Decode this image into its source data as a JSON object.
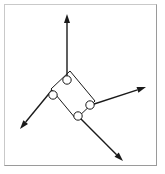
{
  "figure": {
    "canvas": {
      "width": 165,
      "height": 174
    },
    "colors": {
      "background": "#ffffff",
      "frame_light": "#c9c9c9",
      "frame_dark": "#9a9a9a",
      "stroke": "#1a1a1a",
      "joint_fill": "#ffffff"
    },
    "frame": {
      "x": 4,
      "y": 4,
      "width": 153,
      "height": 162,
      "border_width": 1
    },
    "linkage": {
      "label": "parallelogram-linkage",
      "stroke_width": 1,
      "vertices": [
        {
          "name": "top-vertex",
          "x": 70,
          "y": 71
        },
        {
          "name": "right-vertex",
          "x": 95,
          "y": 101
        },
        {
          "name": "bottom-vertex",
          "x": 76,
          "y": 119
        },
        {
          "name": "left-vertex",
          "x": 51,
          "y": 89
        }
      ],
      "path": "M 70 71 L 95 101 L 76 119 L 51 89 Z"
    },
    "joints": [
      {
        "name": "joint-top",
        "cx": 67,
        "cy": 80,
        "r": 4.2
      },
      {
        "name": "joint-left",
        "cx": 53,
        "cy": 95,
        "r": 4.2
      },
      {
        "name": "joint-right",
        "cx": 90,
        "cy": 105,
        "r": 4.2
      },
      {
        "name": "joint-bottom",
        "cx": 78,
        "cy": 116,
        "r": 4.2
      }
    ],
    "vectors": [
      {
        "name": "vector-up",
        "direction": "up",
        "x1": 67,
        "y1": 78,
        "x2": 67,
        "y2": 14,
        "stroke_width": 1.4,
        "head_length": 9,
        "head_width": 6
      },
      {
        "name": "vector-upper-right",
        "direction": "upper-right",
        "x1": 88,
        "y1": 106,
        "x2": 146,
        "y2": 87,
        "stroke_width": 1.4,
        "head_length": 9,
        "head_width": 6
      },
      {
        "name": "vector-lower-left",
        "direction": "lower-left",
        "x1": 52,
        "y1": 90,
        "x2": 20,
        "y2": 129,
        "stroke_width": 1.4,
        "head_length": 9,
        "head_width": 6
      },
      {
        "name": "vector-lower-right",
        "direction": "lower-right",
        "x1": 79,
        "y1": 117,
        "x2": 123,
        "y2": 161,
        "stroke_width": 1.4,
        "head_length": 9,
        "head_width": 6
      }
    ]
  }
}
